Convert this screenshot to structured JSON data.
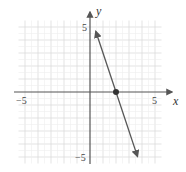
{
  "chart_data": {
    "type": "line",
    "title": "",
    "xlabel": "x",
    "ylabel": "y",
    "xlim": [
      -5.5,
      5.5
    ],
    "ylim": [
      -5.5,
      5.5
    ],
    "grid": true,
    "x_tick_labels": [
      "-5",
      "5"
    ],
    "y_tick_labels": [
      "5",
      "-5"
    ],
    "series": [
      {
        "name": "y = -3x + 6",
        "equation": "y = -3x + 6",
        "x": [
          0.45,
          3.65
        ],
        "y": [
          4.65,
          -4.95
        ],
        "arrows": "both"
      }
    ],
    "points": [
      {
        "label": "x-intercept",
        "x": 2,
        "y": 0
      }
    ]
  },
  "labels": {
    "x_axis": "x",
    "y_axis": "y",
    "x_min_tick": "−5",
    "x_max_tick": "5",
    "y_max_tick": "5",
    "y_min_tick": "−5"
  },
  "colors": {
    "grid": "#dcdcdc",
    "axis": "#555555",
    "line": "#555555",
    "point": "#333333"
  }
}
